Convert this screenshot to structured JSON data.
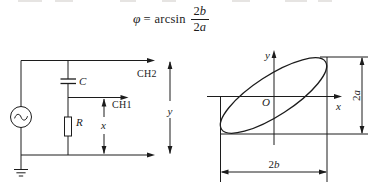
{
  "formula": {
    "phi": "φ",
    "equals": "=",
    "function": "arcsin",
    "numerator": {
      "coeff": "2",
      "var": "b"
    },
    "denominator": {
      "coeff": "2",
      "var": "a"
    }
  },
  "circuit": {
    "capacitor_label": "C",
    "resistor_label": "R",
    "ch2_label": "CH2",
    "ch1_label": "CH1",
    "x_dim_label": "x",
    "y_dim_label": "y"
  },
  "lissajous": {
    "y_axis_label": "y",
    "x_axis_label": "x",
    "origin_label": "O",
    "vertical_dim": {
      "coeff": "2",
      "var": "a"
    },
    "horizontal_dim": {
      "coeff": "2",
      "var": "b"
    }
  },
  "colors": {
    "ink": "#1c1c1c",
    "background": "#ffffff"
  }
}
